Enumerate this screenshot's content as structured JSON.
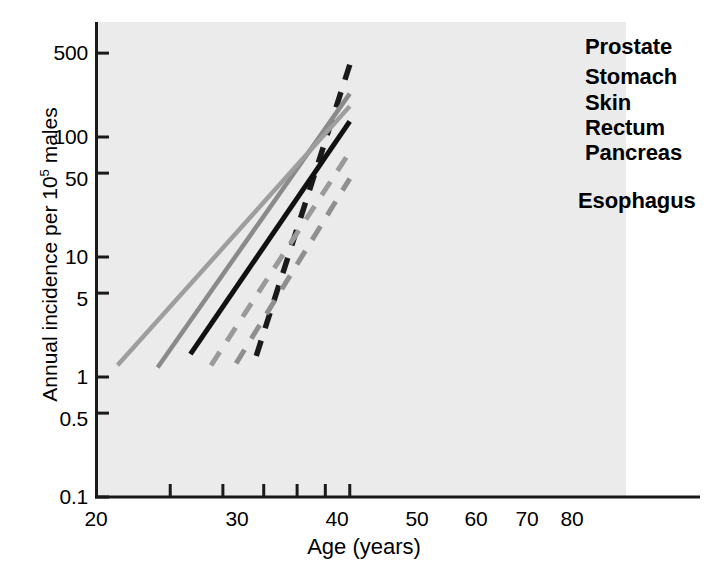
{
  "chart_data": {
    "type": "line",
    "title": "",
    "xlabel": "Age (years)",
    "ylabel_prefix": "Annual incidence per 10",
    "ylabel_exponent": "5",
    "ylabel_suffix": " males",
    "ylabel_full": "Annual incidence per 10⁵ males",
    "xscale": "log",
    "yscale": "log",
    "xlim": [
      20,
      86
    ],
    "ylim": [
      0.1,
      700
    ],
    "grid": false,
    "legend_position": "right-inline-labels",
    "xticks": [
      {
        "value": 20,
        "label": "20"
      },
      {
        "value": 30,
        "label": "30"
      },
      {
        "value": 40,
        "label": "40"
      },
      {
        "value": 50,
        "label": "50"
      },
      {
        "value": 60,
        "label": "60"
      },
      {
        "value": 70,
        "label": "70"
      },
      {
        "value": 80,
        "label": "80"
      }
    ],
    "yticks": [
      {
        "value": 500,
        "label": "500"
      },
      {
        "value": 100,
        "label": "100"
      },
      {
        "value": 50,
        "label": "50"
      },
      {
        "value": 10,
        "label": "10"
      },
      {
        "value": 5,
        "label": "5"
      },
      {
        "value": 1,
        "label": "1"
      },
      {
        "value": 0.5,
        "label": "0.5"
      },
      {
        "value": 0.1,
        "label": "0.1"
      }
    ],
    "series": [
      {
        "name": "Prostate",
        "label": "Prostate",
        "style": "dashed",
        "color": "#1a1a1a",
        "width": 5.5,
        "x": [
          48,
          80
        ],
        "y": [
          1.5,
          400
        ]
      },
      {
        "name": "Stomach",
        "label": "Stomach",
        "style": "solid",
        "color": "#8a8a8a",
        "width": 4.5,
        "x": [
          28,
          80
        ],
        "y": [
          1.2,
          230
        ]
      },
      {
        "name": "Skin",
        "label": "Skin",
        "style": "solid",
        "color": "#9e9e9e",
        "width": 4.5,
        "x": [
          22.5,
          80
        ],
        "y": [
          1.25,
          180
        ]
      },
      {
        "name": "Rectum",
        "label": "Rectum",
        "style": "solid",
        "color": "#111111",
        "width": 5,
        "x": [
          33.5,
          80
        ],
        "y": [
          1.55,
          135
        ]
      },
      {
        "name": "Pancreas",
        "label": "Pancreas",
        "style": "dashed",
        "color": "#9a9a9a",
        "width": 5,
        "x": [
          37.5,
          80
        ],
        "y": [
          1.25,
          75
        ]
      },
      {
        "name": "Esophagus",
        "label": "Esophagus",
        "style": "dashed",
        "color": "#8f8f8f",
        "width": 5,
        "x": [
          43,
          80
        ],
        "y": [
          1.3,
          45
        ]
      }
    ]
  },
  "colors": {
    "plot_background": "#ebebeb",
    "axis": "#1a1a1a",
    "text": "#000000"
  }
}
